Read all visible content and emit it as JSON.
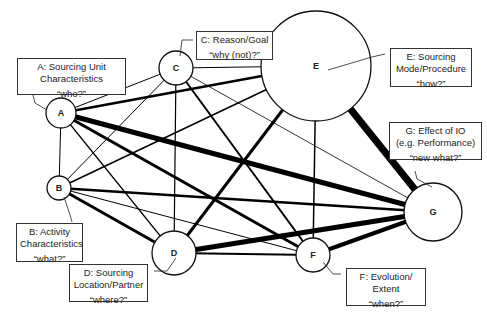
{
  "diagram": {
    "nodes": [
      {
        "id": "A",
        "letter": "A",
        "cx": 61,
        "cy": 113,
        "r": 15,
        "title": "A: Sourcing Unit Characteristics",
        "line1": "A: Sourcing Unit",
        "line2": "Characteristics",
        "question": "“who?”"
      },
      {
        "id": "B",
        "letter": "B",
        "cx": 59,
        "cy": 188,
        "r": 12,
        "title": "B: Activity Characteristics",
        "line1": "B: Activity",
        "line2": "Characteristics",
        "question": "“what?”"
      },
      {
        "id": "C",
        "letter": "C",
        "cx": 176,
        "cy": 68,
        "r": 17,
        "title": "C: Reason/Goal",
        "line1": "C: Reason/Goal",
        "line2": "",
        "question": "“why (not)?”"
      },
      {
        "id": "D",
        "letter": "D",
        "cx": 174,
        "cy": 253,
        "r": 22,
        "title": "D: Sourcing Location/Partner",
        "line1": "D: Sourcing",
        "line2": "Location/Partner",
        "question": "“where?”"
      },
      {
        "id": "E",
        "letter": "E",
        "cx": 316,
        "cy": 66,
        "r": 55,
        "title": "E: Sourcing Mode/Procedure",
        "line1": "E: Sourcing",
        "line2": "Mode/Procedure",
        "question": "“how?”"
      },
      {
        "id": "F",
        "letter": "F",
        "cx": 313,
        "cy": 255,
        "r": 17,
        "title": "F: Evolution/ Extent",
        "line1": "F: Evolution/",
        "line2": "Extent",
        "question": "“when?”"
      },
      {
        "id": "G",
        "letter": "G",
        "cx": 433,
        "cy": 212,
        "r": 29,
        "title": "G: Effect of IO (e.g. Performance)",
        "line1": "G: Effect of IO",
        "line2": "(e.g. Performance)",
        "question": "“new what?”"
      }
    ],
    "edges": [
      {
        "from": "A",
        "to": "B",
        "weight": 1
      },
      {
        "from": "A",
        "to": "C",
        "weight": 1
      },
      {
        "from": "A",
        "to": "E",
        "weight": 2.5
      },
      {
        "from": "A",
        "to": "G",
        "weight": 5
      },
      {
        "from": "A",
        "to": "F",
        "weight": 3
      },
      {
        "from": "A",
        "to": "D",
        "weight": 1.2
      },
      {
        "from": "B",
        "to": "C",
        "weight": 1
      },
      {
        "from": "B",
        "to": "E",
        "weight": 1.5
      },
      {
        "from": "B",
        "to": "G",
        "weight": 2.5
      },
      {
        "from": "B",
        "to": "D",
        "weight": 3
      },
      {
        "from": "B",
        "to": "F",
        "weight": 1
      },
      {
        "from": "C",
        "to": "D",
        "weight": 1.2
      },
      {
        "from": "C",
        "to": "E",
        "weight": 1
      },
      {
        "from": "C",
        "to": "F",
        "weight": 2
      },
      {
        "from": "C",
        "to": "G",
        "weight": 0.8
      },
      {
        "from": "D",
        "to": "E",
        "weight": 3
      },
      {
        "from": "D",
        "to": "G",
        "weight": 5
      },
      {
        "from": "D",
        "to": "F",
        "weight": 2
      },
      {
        "from": "E",
        "to": "F",
        "weight": 1.5
      },
      {
        "from": "E",
        "to": "G",
        "weight": 7
      },
      {
        "from": "F",
        "to": "G",
        "weight": 4
      }
    ]
  },
  "labels": {
    "A": {
      "line1": "A: Sourcing Unit",
      "line2": "Characteristics",
      "question": "“who?”"
    },
    "B": {
      "line1": "B: Activity",
      "line2": "Characteristics",
      "question": "“what?”"
    },
    "C": {
      "line1": "C: Reason/Goal",
      "question": "“why (not)?”"
    },
    "D": {
      "line1": "D: Sourcing",
      "line2": "Location/Partner",
      "question": "“where?”"
    },
    "E": {
      "line1": "E: Sourcing",
      "line2": "Mode/Procedure",
      "question": "“how?”"
    },
    "F": {
      "line1": "F: Evolution/",
      "line2": "Extent",
      "question": "“when?”"
    },
    "G": {
      "line1": "G: Effect of IO",
      "line2": "(e.g. Performance)",
      "question": "“new what?”"
    }
  },
  "letters": {
    "A": "A",
    "B": "B",
    "C": "C",
    "D": "D",
    "E": "E",
    "F": "F",
    "G": "G"
  }
}
